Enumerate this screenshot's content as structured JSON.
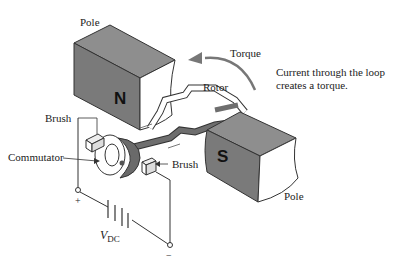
{
  "diagram": {
    "labels": {
      "pole_top": "Pole",
      "pole_bottom": "Pole",
      "torque": "Torque",
      "rotor": "Rotor",
      "brush_left": "Brush",
      "brush_right": "Brush",
      "commutator": "Commutator",
      "north": "N",
      "south": "S",
      "plus": "+",
      "minus": "−",
      "vdc_main": "V",
      "vdc_sub": "DC"
    },
    "caption": {
      "line1": "Current through the loop",
      "line2": "creates a torque."
    },
    "colors": {
      "pole_face": "#7a7a7a",
      "pole_top": "#8c8c8c",
      "pole_side": "#ffffff",
      "rotor": "#6e6e6e",
      "outline": "#333333",
      "arrow": "#777777"
    }
  }
}
